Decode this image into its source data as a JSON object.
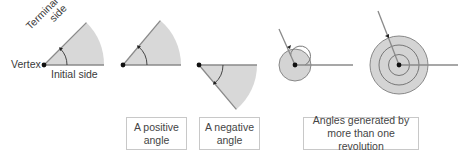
{
  "figure": {
    "annotations": {
      "terminal_side": "Terminal side",
      "terminal_line1": "Terminal",
      "terminal_line2": "side",
      "vertex": "Vertex",
      "initial_side": "Initial side"
    },
    "captions": [
      {
        "line1": "A positive",
        "line2": "angle"
      },
      {
        "line1": "A negative",
        "line2": "angle"
      },
      {
        "line1": "Angles generated by",
        "line2": "more than one revolution"
      }
    ],
    "colors": {
      "sector_fill": "#d6d6d6",
      "line": "#888888",
      "vertex": "#111111",
      "caption_border": "#c8c8c8"
    }
  }
}
